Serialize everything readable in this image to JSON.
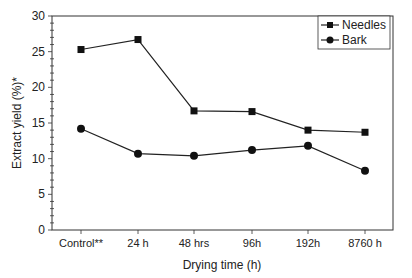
{
  "chart_data": {
    "type": "line",
    "title": "",
    "xlabel": "Drying time (h)",
    "ylabel": "Extract yield (%)*",
    "categories": [
      "Control**",
      "24 h",
      "48 hrs",
      "96h",
      "192h",
      "8760 h"
    ],
    "series": [
      {
        "name": "Needles",
        "marker": "square",
        "values": [
          25.3,
          26.7,
          16.7,
          16.6,
          14.0,
          13.7
        ]
      },
      {
        "name": "Bark",
        "marker": "circle",
        "values": [
          14.2,
          10.7,
          10.4,
          11.2,
          11.8,
          8.3
        ]
      }
    ],
    "ylim": [
      0,
      30
    ],
    "yticks": [
      0,
      5,
      10,
      15,
      20,
      25,
      30
    ],
    "grid": false,
    "legend_position": "upper right"
  },
  "colors": {
    "line": "#222222",
    "axis": "#333333",
    "background": "#ffffff"
  }
}
